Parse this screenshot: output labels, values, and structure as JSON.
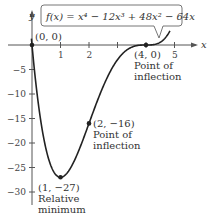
{
  "chart_data": {
    "type": "line",
    "function_label": "f(x) = x⁴ − 12x³ + 48x² − 64x",
    "xlabel": "x",
    "ylabel": "y",
    "xlim": [
      -0.2,
      5.3
    ],
    "ylim": [
      -31,
      3
    ],
    "x_ticks": [
      1,
      2,
      3,
      4,
      5
    ],
    "x_tick_labels": [
      "1",
      "2",
      "",
      "",
      "5"
    ],
    "y_ticks": [
      -5,
      -10,
      -15,
      -20,
      -25,
      -30
    ],
    "y_tick_labels": [
      "−5",
      "−10",
      "−15",
      "−20",
      "−25",
      "−30"
    ],
    "grid": false,
    "points": [
      {
        "x": 0,
        "y": 0,
        "label": "(0, 0)",
        "note": ""
      },
      {
        "x": 1,
        "y": -27,
        "label": "(1, −27)",
        "note": "Relative minimum"
      },
      {
        "x": 2,
        "y": -16,
        "label": "(2, −16)",
        "note": "Point of inflection"
      },
      {
        "x": 4,
        "y": 0,
        "label": "(4, 0)",
        "note": "Point of inflection"
      }
    ],
    "curve_samples": {
      "x": [
        -0.1,
        0,
        0.25,
        0.5,
        0.75,
        1,
        1.25,
        1.5,
        1.75,
        2,
        2.5,
        3,
        3.5,
        4,
        4.5,
        4.8
      ],
      "y": [
        6.5,
        0,
        -13.3,
        -20.9,
        -25.3,
        -27,
        -26.6,
        -24.7,
        -21.0,
        -16,
        -8.4,
        -3,
        -0.4,
        0,
        1.7,
        8.2
      ]
    }
  },
  "labels": {
    "y_axis": "y",
    "x_axis": "x",
    "function": "f(x) = x⁴ − 12x³ + 48x² − 64x",
    "p0": "(0, 0)",
    "p1": "(1, −27)",
    "p1_note_1": "Relative",
    "p1_note_2": "minimum",
    "p2": "(2, −16)",
    "p2_note_1": "Point of",
    "p2_note_2": "inflection",
    "p4": "(4, 0)",
    "p4_note_1": "Point of",
    "p4_note_2": "inflection"
  }
}
